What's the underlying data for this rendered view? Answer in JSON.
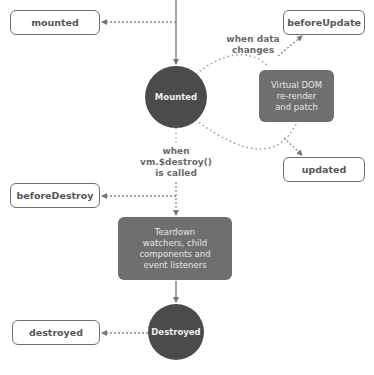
{
  "diagram": {
    "colors": {
      "state_fill": "#4b4b4b",
      "process_fill": "#6f6f6f",
      "hook_border": "#6e6e6e",
      "line": "#777777",
      "text": "#555555"
    },
    "hooks": {
      "mounted": "mounted",
      "before_update": "beforeUpdate",
      "updated": "updated",
      "before_destroy": "beforeDestroy",
      "destroyed": "destroyed"
    },
    "states": {
      "mounted": "Mounted",
      "destroyed": "Destroyed"
    },
    "processes": {
      "virtual_dom": [
        "Virtual DOM",
        "re-render",
        "and patch"
      ],
      "teardown": [
        "Teardown",
        "watchers, child",
        "components and",
        "event listeners"
      ]
    },
    "conditions": {
      "data_changes": [
        "when data",
        "changes"
      ],
      "destroy_called": [
        "when",
        "vm.$destroy()",
        "is called"
      ]
    }
  }
}
